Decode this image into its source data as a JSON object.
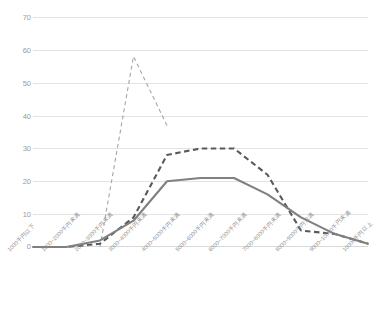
{
  "chart_data": {
    "type": "line",
    "title": "",
    "xlabel": "",
    "ylabel": "",
    "ylim": [
      0,
      70
    ],
    "yticks": [
      0,
      10,
      20,
      30,
      40,
      50,
      60,
      70
    ],
    "grid": true,
    "legend": "none",
    "categories": [
      "1000千円以下",
      "1000~2000千円未満",
      "2000~3000千円未満",
      "3000~4000千円未満",
      "4000~5000千円未満",
      "5000~6000千円未満",
      "6000~7000千円未満",
      "7000~8000千円未満",
      "8000~9000千円未満",
      "9000~10000千円未満",
      "10000千円以上"
    ],
    "series": [
      {
        "name": "series-1",
        "style": "dashed-thin",
        "color": "#a6a6a6",
        "values": [
          null,
          null,
          0,
          58,
          37,
          null,
          null,
          null,
          null,
          null,
          null
        ]
      },
      {
        "name": "series-2",
        "style": "dashed-thick",
        "color": "#5a5a5a",
        "values": [
          0,
          0,
          1,
          9,
          28,
          30,
          30,
          22,
          5,
          4,
          1
        ]
      },
      {
        "name": "series-3",
        "style": "solid",
        "color": "#808080",
        "values": [
          0,
          0,
          2,
          8,
          20,
          21,
          21,
          16,
          9,
          4,
          1
        ]
      }
    ]
  },
  "axis": {
    "y_labels": [
      "0",
      "10",
      "20",
      "30",
      "40",
      "50",
      "60",
      "70"
    ]
  }
}
